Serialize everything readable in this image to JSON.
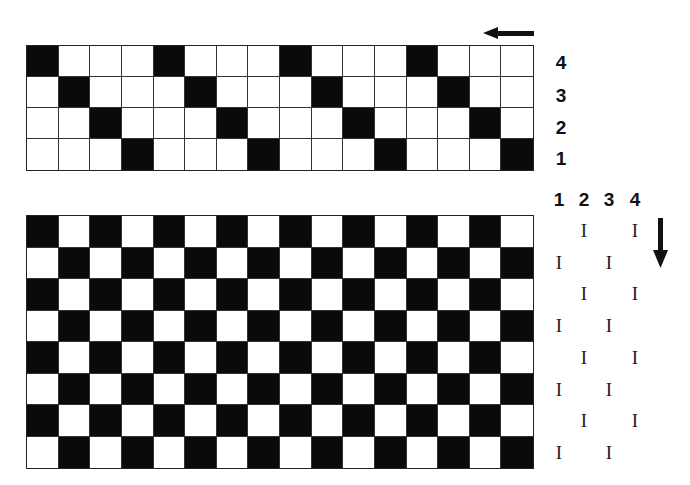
{
  "top_grid": {
    "rows": 4,
    "cols": 16,
    "row_labels": [
      "4",
      "3",
      "2",
      "1"
    ],
    "pattern": [
      [
        1,
        0,
        0,
        0,
        1,
        0,
        0,
        0,
        1,
        0,
        0,
        0,
        1,
        0,
        0,
        0
      ],
      [
        0,
        1,
        0,
        0,
        0,
        1,
        0,
        0,
        0,
        1,
        0,
        0,
        0,
        1,
        0,
        0
      ],
      [
        0,
        0,
        1,
        0,
        0,
        0,
        1,
        0,
        0,
        0,
        1,
        0,
        0,
        0,
        1,
        0
      ],
      [
        0,
        0,
        0,
        1,
        0,
        0,
        0,
        1,
        0,
        0,
        0,
        1,
        0,
        0,
        0,
        1
      ]
    ],
    "arrow_direction": "left"
  },
  "bottom_grid": {
    "rows": 8,
    "cols": 16,
    "pattern_type": "checkerboard",
    "first_cell_black": true,
    "arrow_direction": "down"
  },
  "shaft_columns": {
    "headers": [
      "1",
      "2",
      "3",
      "4"
    ],
    "mark_glyph": "I",
    "rows": [
      [
        0,
        1,
        0,
        1
      ],
      [
        1,
        0,
        1,
        0
      ],
      [
        0,
        1,
        0,
        1
      ],
      [
        1,
        0,
        1,
        0
      ],
      [
        0,
        1,
        0,
        1
      ],
      [
        1,
        0,
        1,
        0
      ],
      [
        0,
        1,
        0,
        1
      ],
      [
        1,
        0,
        1,
        0
      ]
    ]
  },
  "colors": {
    "black": "#0a0a0a",
    "white": "#ffffff",
    "line": "#333333"
  }
}
